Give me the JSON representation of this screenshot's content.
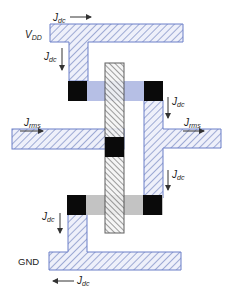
{
  "diagram": {
    "type": "layout-current-density",
    "colors": {
      "metal_hatch": "#5b6fb5",
      "metal_border": "#6b7fc8",
      "metal_fill": "#e9ecf8",
      "poly_hatch": "#333333",
      "poly_border": "#444444",
      "poly_fill": "#f2f2f2",
      "pdiff": "#aab4e0",
      "ndiff": "#b8b8b8",
      "contact": "#0a0a0a",
      "arrow": "#333333"
    },
    "labels": {
      "vdd_main": "V",
      "vdd_sub": "DD",
      "gnd": "GND",
      "jdc_main": "J",
      "jdc_sub": "dc",
      "jrms_main": "J",
      "jrms_sub": "rms"
    },
    "nodes": [
      {
        "id": "vdd-rail",
        "label": "VDD"
      },
      {
        "id": "gnd-rail",
        "label": "GND"
      },
      {
        "id": "input-wire",
        "label": "Jrms in"
      },
      {
        "id": "output-wire",
        "label": "Jrms out"
      },
      {
        "id": "gate-poly"
      },
      {
        "id": "pmos-diffusion"
      },
      {
        "id": "nmos-diffusion"
      }
    ],
    "arrows": [
      {
        "label": "Jdc",
        "direction": "right",
        "location": "above VDD rail"
      },
      {
        "label": "Jdc",
        "direction": "down",
        "location": "VDD stem"
      },
      {
        "label": "Jdc",
        "direction": "down",
        "location": "output upper"
      },
      {
        "label": "Jrms",
        "direction": "right",
        "location": "input"
      },
      {
        "label": "Jrms",
        "direction": "right",
        "location": "output"
      },
      {
        "label": "Jdc",
        "direction": "down",
        "location": "output lower"
      },
      {
        "label": "Jdc",
        "direction": "down",
        "location": "GND stem"
      },
      {
        "label": "Jdc",
        "direction": "left",
        "location": "below GND rail"
      }
    ]
  }
}
